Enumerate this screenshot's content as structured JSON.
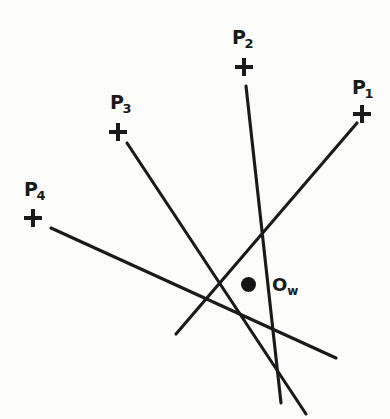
{
  "figure": {
    "background_color": "#fcfcfa",
    "ink_color": "#1a1a1a",
    "width": 390,
    "height": 419,
    "points": [
      {
        "id": "P1",
        "label_base": "P",
        "label_sub": "1",
        "label_x": 352,
        "label_y": 78,
        "marker_x": 353,
        "marker_y": 105,
        "marker_glyph": "plus-marker"
      },
      {
        "id": "P2",
        "label_base": "P",
        "label_sub": "2",
        "label_x": 232,
        "label_y": 28,
        "marker_x": 235,
        "marker_y": 58,
        "marker_glyph": "plus-marker"
      },
      {
        "id": "P3",
        "label_base": "P",
        "label_sub": "3",
        "label_x": 110,
        "label_y": 93,
        "marker_x": 109,
        "marker_y": 123,
        "marker_glyph": "plus-marker"
      },
      {
        "id": "P4",
        "label_base": "P",
        "label_sub": "4",
        "label_x": 24,
        "label_y": 180,
        "marker_x": 24,
        "marker_y": 209,
        "marker_glyph": "plus-marker"
      }
    ],
    "origin": {
      "id": "Ow",
      "label_base": "O",
      "label_sub": "w",
      "label_x": 272,
      "label_y": 276,
      "dot_x": 241,
      "dot_y": 277,
      "dot_radius": 7.5
    },
    "lines": [
      {
        "id": "line-P1",
        "from_point": "P1",
        "x1": 357,
        "y1": 123,
        "x2": 176,
        "y2": 334,
        "stroke_width": 3.1
      },
      {
        "id": "line-P2",
        "from_point": "P2",
        "x1": 246,
        "y1": 86,
        "x2": 281,
        "y2": 403,
        "stroke_width": 3.1
      },
      {
        "id": "line-P3",
        "from_point": "P3",
        "x1": 127,
        "y1": 143,
        "x2": 306,
        "y2": 414,
        "stroke_width": 3.1
      },
      {
        "id": "line-P4",
        "from_point": "P4",
        "x1": 51,
        "y1": 228,
        "x2": 336,
        "y2": 358,
        "stroke_width": 3.1
      }
    ]
  },
  "chart_data": {
    "type": "scatter",
    "xlabel": "",
    "ylabel": "",
    "xlim": [
      0,
      390
    ],
    "ylim": [
      0,
      419
    ],
    "grid": false,
    "legend": "none",
    "annotations": [
      "P1",
      "P2",
      "P3",
      "P4",
      "Ow"
    ],
    "series": [
      {
        "name": "marked-points",
        "marker": "plus",
        "labels": [
          "P1",
          "P2",
          "P3",
          "P4"
        ],
        "x": [
          362,
          244,
          118,
          33
        ],
        "y": [
          114,
          67,
          132,
          218
        ]
      },
      {
        "name": "world-origin",
        "marker": "filled-circle",
        "labels": [
          "Ow"
        ],
        "x": [
          248
        ],
        "y": [
          285
        ]
      }
    ],
    "lines": [
      {
        "name": "line-P1",
        "x": [
          357,
          176
        ],
        "y": [
          123,
          334
        ]
      },
      {
        "name": "line-P2",
        "x": [
          246,
          281
        ],
        "y": [
          86,
          403
        ]
      },
      {
        "name": "line-P3",
        "x": [
          127,
          306
        ],
        "y": [
          143,
          414
        ]
      },
      {
        "name": "line-P4",
        "x": [
          51,
          336
        ],
        "y": [
          228,
          358
        ]
      }
    ]
  }
}
